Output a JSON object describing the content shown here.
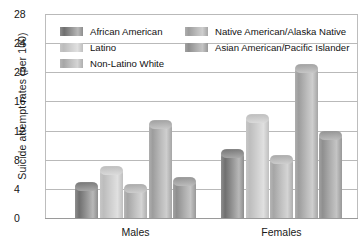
{
  "chart_data": {
    "type": "bar",
    "title": "",
    "xlabel": "",
    "ylabel": "Suicide attempt rates (per 100)",
    "categories": [
      "Males",
      "Females"
    ],
    "series": [
      {
        "name": "African American",
        "values": [
          4.8,
          9.3
        ],
        "color": "#8e8e8e"
      },
      {
        "name": "Latino",
        "values": [
          7.0,
          14.2
        ],
        "color": "#c6c6c6"
      },
      {
        "name": "Non-Latino White",
        "values": [
          4.5,
          8.5
        ],
        "color": "#b5b5b5"
      },
      {
        "name": "Native American/Alaska Native",
        "values": [
          13.3,
          21.0
        ],
        "color": "#aeaeae"
      },
      {
        "name": "Asian American/Pacific Islander",
        "values": [
          5.5,
          11.8
        ],
        "color": "#a2a2a2"
      }
    ],
    "ylim": [
      0,
      28
    ],
    "yticks": [
      0,
      4,
      8,
      12,
      16,
      20,
      24,
      28
    ],
    "ytick_labels": [
      "0",
      "4",
      "8",
      "12",
      "16",
      "20",
      "24",
      "28"
    ],
    "grid": true,
    "legend_position": "top"
  },
  "axis": {
    "y_title": "Suicide attempt rates (per 100)"
  },
  "legend": {
    "items": [
      {
        "label": "African American"
      },
      {
        "label": "Latino"
      },
      {
        "label": "Non-Latino White"
      },
      {
        "label": "Native American/Alaska Native"
      },
      {
        "label": "Asian American/Pacific Islander"
      }
    ]
  }
}
